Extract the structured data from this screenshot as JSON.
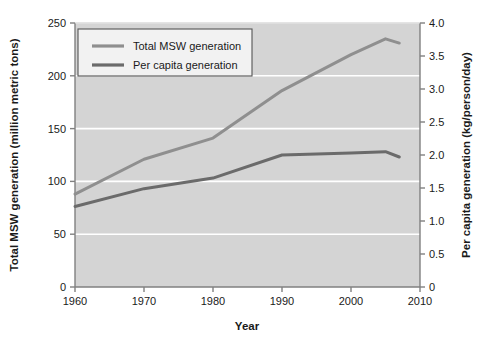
{
  "chart_data": {
    "type": "line",
    "title": "",
    "xlabel": "Year",
    "ylabel": "Total MSW generation (million metric tons)",
    "y2label": "Per capita generation (kg/person/day)",
    "xlim": [
      1960,
      2010
    ],
    "ylim": [
      0,
      250
    ],
    "y2lim": [
      0,
      4.0
    ],
    "xticks": [
      1960,
      1970,
      1980,
      1990,
      2000,
      2010
    ],
    "xtick_labels": [
      "1960",
      "1970",
      "1980",
      "1990",
      "2000",
      "2010"
    ],
    "yticks": [
      0,
      50,
      100,
      150,
      200,
      250
    ],
    "ytick_labels": [
      "0",
      "50",
      "100",
      "150",
      "200",
      "250"
    ],
    "y2ticks": [
      0,
      0.5,
      1.0,
      1.5,
      2.0,
      2.5,
      3.0,
      3.5,
      4.0
    ],
    "y2tick_labels": [
      "0",
      "0.5",
      "1.0",
      "1.5",
      "2.0",
      "2.5",
      "3.0",
      "3.5",
      "4.0"
    ],
    "grid": "horizontal-white",
    "plot_background": "#d4d4d4",
    "legend_position": "upper-left",
    "series": [
      {
        "name": "Total MSW generation",
        "axis": "left",
        "color": "#8f8f8f",
        "x": [
          1960,
          1970,
          1980,
          1990,
          2000,
          2005,
          2007
        ],
        "values": [
          88,
          121,
          141,
          186,
          220,
          235,
          231
        ]
      },
      {
        "name": "Per capita generation",
        "axis": "right",
        "color": "#6b6b6b",
        "x": [
          1960,
          1970,
          1980,
          1990,
          2000,
          2005,
          2007
        ],
        "values": [
          1.22,
          1.49,
          1.65,
          2.0,
          2.03,
          2.05,
          1.97
        ]
      }
    ]
  },
  "legend": {
    "items": [
      {
        "label": "Total MSW generation",
        "color": "#8f8f8f"
      },
      {
        "label": "Per capita generation",
        "color": "#6b6b6b"
      }
    ]
  },
  "colors": {
    "page_background": "#ffffff",
    "plot_area": "#d4d4d4",
    "gridline": "#ffffff",
    "axis": "#808080",
    "text": "#1a1a1a",
    "series_total": "#8f8f8f",
    "series_percapita": "#6b6b6b",
    "legend_background": "#f2f2f2",
    "legend_border": "#555555"
  }
}
